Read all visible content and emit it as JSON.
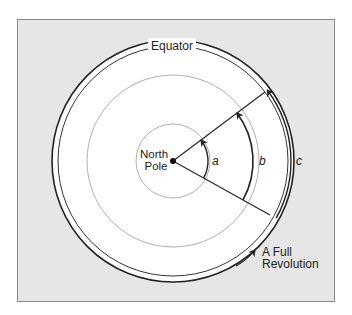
{
  "diagram": {
    "type": "polar-angle-diagram",
    "labels": {
      "equator": "Equator",
      "north": "North",
      "pole": "Pole",
      "arc_a": "a",
      "arc_b": "b",
      "arc_c": "c",
      "full_line1": "A Full",
      "full_line2": "Revolution"
    },
    "colors": {
      "frame_background": "#e6e6e6",
      "frame_border": "#8a8a8a",
      "disk": "#ffffff",
      "ink": "#222222",
      "thin_circle": "#9a9a9a"
    }
  }
}
